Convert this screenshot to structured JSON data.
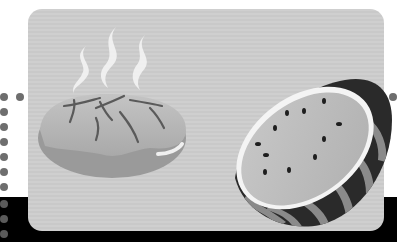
{
  "scene": {
    "description": "Grayscale illustration card with steaming bread loaf and half watermelon",
    "subjects": [
      {
        "name": "steam",
        "count": 3
      },
      {
        "name": "bread-loaf"
      },
      {
        "name": "watermelon-half",
        "seed_count": 11
      }
    ],
    "left_dot_column": {
      "count_on_white": 8,
      "count_on_black": 3
    },
    "right_dot_count": 1,
    "colors": {
      "panel": "#cccccc",
      "bread_top": "#b3b3b3",
      "bread_side": "#9a9a9a",
      "steam": "#f2f2f2",
      "watermelon_flesh": "#bdbdbd",
      "watermelon_rind": "#2a2a2a",
      "rind_stripe": "#8a8a8a",
      "band": "#000000",
      "dots": "#6e6e6e"
    }
  }
}
